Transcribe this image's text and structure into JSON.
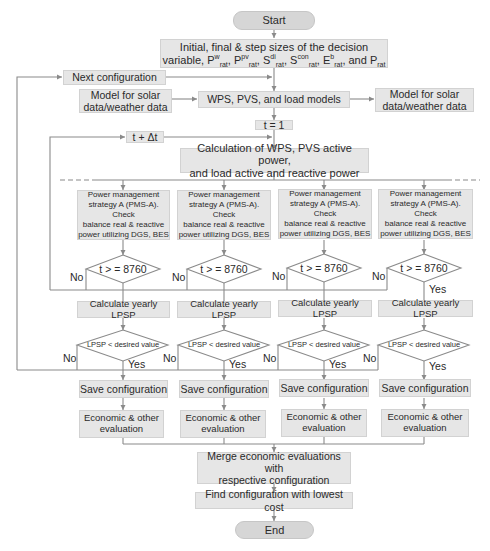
{
  "diagram": {
    "type": "flowchart",
    "start": "Start",
    "end": "End",
    "init_box": {
      "line1": "Initial, final & step sizes of the decision",
      "line2_prefix": "variable, P",
      "vars": [
        {
          "base": "P",
          "sup": "w",
          "sub": "rat"
        },
        {
          "base": "P",
          "sup": "pv",
          "sub": "rat"
        },
        {
          "base": "S",
          "sup": "di",
          "sub": "rat"
        },
        {
          "base": "S",
          "sup": "con",
          "sub": "rat"
        },
        {
          "base": "E",
          "sup": "b",
          "sub": "rat"
        },
        {
          "base": "P",
          "sup": "",
          "sub": "rat"
        }
      ],
      "full_text": "Initial, final & step sizes of the decision variable, Pʷrat, Pᵖᵛrat, Sᵈⁱrat, Sᶜᵒⁿrat, Eᵇrat, and Prat"
    },
    "next_config": "Next configuration",
    "model_left": [
      "Model for solar",
      "data/weather data"
    ],
    "model_right": [
      "Model for solar",
      "data/weather data"
    ],
    "models": "WPS, PVS, and load models",
    "t_init": "t = 1",
    "t_step": "t + Δt",
    "calc": [
      "Calculation of WPS, PVS active power,",
      "and load active and reactive power"
    ],
    "branches": [
      {
        "pms": [
          "Power management",
          "strategy A (PMS-A). Check",
          "balance real & reactive",
          "power utilizing DGS, BES"
        ],
        "time_check": "t > = 8760",
        "time_no": "No",
        "time_yes": "",
        "lpsp": "Calculate yearly LPSP",
        "lpsp_check": "LPSP < desired value",
        "lpsp_no": "No",
        "lpsp_yes": "Yes",
        "save": "Save configuration",
        "econ": [
          "Economic & other",
          "evaluation"
        ]
      },
      {
        "pms": [
          "Power management",
          "strategy A (PMS-A). Check",
          "balance real & reactive",
          "power utilizing DGS, BES"
        ],
        "time_check": "t > = 8760",
        "time_no": "No",
        "time_yes": "",
        "lpsp": "Calculate yearly LPSP",
        "lpsp_check": "LPSP < desired value",
        "lpsp_no": "No",
        "lpsp_yes": "Yes",
        "save": "Save configuration",
        "econ": [
          "Economic & other",
          "evaluation"
        ]
      },
      {
        "pms": [
          "Power management",
          "strategy A (PMS-A). Check",
          "balance real & reactive",
          "power utilizing DGS, BES"
        ],
        "time_check": "t > = 8760",
        "time_no": "No",
        "time_yes": "",
        "lpsp": "Calculate yearly LPSP",
        "lpsp_check": "LPSP < desired value",
        "lpsp_no": "No",
        "lpsp_yes": "Yes",
        "save": "Save configuration",
        "econ": [
          "Economic & other",
          "evaluation"
        ]
      },
      {
        "pms": [
          "Power management",
          "strategy A (PMS-A). Check",
          "balance real & reactive",
          "power utilizing DGS, BES"
        ],
        "time_check": "t > = 8760",
        "time_no": "No",
        "time_yes": "Yes",
        "lpsp": "Calculate yearly LPSP",
        "lpsp_check": "LPSP < desired value",
        "lpsp_no": "No",
        "lpsp_yes": "Yes",
        "save": "Save configuration",
        "econ": [
          "Economic & other",
          "evaluation"
        ]
      }
    ],
    "merge": [
      "Merge economic evaluations with",
      "respective configuration"
    ],
    "find": "Find configuration with lowest cost",
    "colors": {
      "box_fill": "#e6e6e6",
      "terminal_fill": "#d6d6d6",
      "line": "#8a8a8a",
      "text": "#2a2a2a"
    }
  }
}
